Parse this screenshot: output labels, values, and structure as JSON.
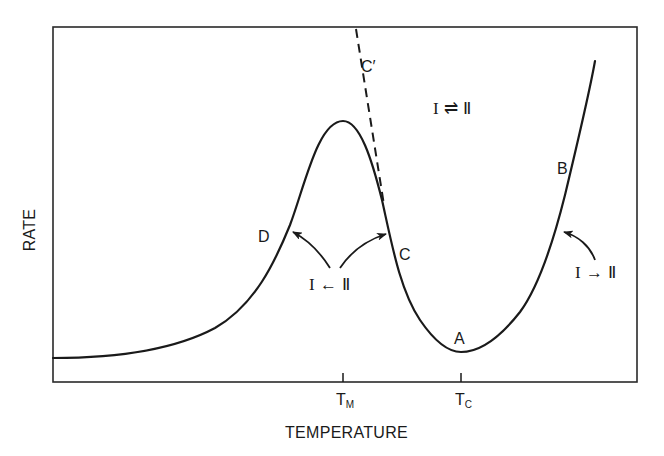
{
  "figure": {
    "x_axis": {
      "title": "TEMPERATURE",
      "ticks": [
        {
          "main": "T",
          "sub": "M"
        },
        {
          "main": "T",
          "sub": "C"
        }
      ]
    },
    "y_axis": {
      "title": "RATE"
    },
    "curve_points": {
      "A": "A",
      "B": "B",
      "C": "C",
      "C_prime": "C′",
      "D": "D"
    },
    "annotations": {
      "equilibrium": "I ⇌ Ⅱ",
      "reverse_reaction": "I ← Ⅱ",
      "forward_reaction": "I → Ⅱ"
    },
    "colors": {
      "ink": "#1a1a1a",
      "background": "#ffffff"
    }
  }
}
